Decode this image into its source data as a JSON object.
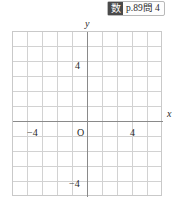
{
  "reference": {
    "subject_icon": "数",
    "subject_icon_name": "math-subject-chip",
    "text": "p.89問 4"
  },
  "graph": {
    "y_axis_caption": "y",
    "x_axis_caption": "x",
    "origin_label": "O",
    "x_tick_negative": "−4",
    "x_tick_positive": "4",
    "y_tick_positive": "4",
    "y_tick_negative": "−4"
  },
  "chart_data": {
    "type": "scatter",
    "title": "",
    "xlabel": "x",
    "ylabel": "y",
    "series": [],
    "x": [],
    "values": [],
    "xlim": [
      -5,
      5
    ],
    "ylim": [
      -6,
      5
    ],
    "xticks": [
      -4,
      0,
      4
    ],
    "yticks": [
      -4,
      0,
      4
    ],
    "xtick_labels": [
      "−4",
      "O",
      "4"
    ],
    "ytick_labels": [
      "−4",
      "",
      "4"
    ],
    "grid": true,
    "grid_columns": 10,
    "grid_rows": 11,
    "grid_step": 1,
    "legend": "none"
  },
  "colors": {
    "grid_line": "#d2d2d2",
    "axis_line": "#8a8a8a",
    "plot_border": "#c9c9c9",
    "text": "#1f1f1f",
    "badge_chip_bg": "#4a4a4a",
    "badge_border": "#b9b9b9",
    "page_bg": "#ffffff"
  }
}
